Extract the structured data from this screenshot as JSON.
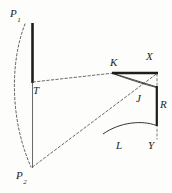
{
  "figure": {
    "background_color": "#fdfdfc",
    "ink_color": "#1d1d1d",
    "labels": {
      "p1": "P",
      "p1_sub": "1",
      "p2": "P",
      "p2_sub": "2",
      "t": "T",
      "k": "K",
      "x": "X",
      "j": "J",
      "r": "R",
      "l": "L",
      "y": "Y"
    },
    "elements": [
      {
        "name": "left-thick-bar",
        "type": "line",
        "style": "solid-thick",
        "from": [
          32,
          23
        ],
        "to": [
          32,
          82
        ]
      },
      {
        "name": "left-thin-bar",
        "type": "line",
        "style": "solid-thin",
        "from": [
          32,
          82
        ],
        "to": [
          32,
          168
        ]
      },
      {
        "name": "left-dashed-arc",
        "type": "arc",
        "style": "dashed",
        "from": [
          25,
          23
        ],
        "to": [
          32,
          168
        ],
        "bulge": "left"
      },
      {
        "name": "t-to-k-dashed",
        "type": "line",
        "style": "dashed",
        "from": [
          32,
          82
        ],
        "to": [
          113,
          73
        ]
      },
      {
        "name": "p2-to-x-dashed",
        "type": "line",
        "style": "dashed",
        "from": [
          32,
          168
        ],
        "to": [
          157,
          73
        ]
      },
      {
        "name": "kx-thick-bar",
        "type": "line",
        "style": "solid-thick",
        "from": [
          113,
          73
        ],
        "to": [
          157,
          73
        ]
      },
      {
        "name": "k-to-r-line",
        "type": "line",
        "style": "solid-thin",
        "from": [
          113,
          73
        ],
        "to": [
          157,
          87
        ]
      },
      {
        "name": "k-arc-to-r",
        "type": "arc",
        "style": "solid-thin",
        "from": [
          113,
          73
        ],
        "to": [
          157,
          87
        ],
        "bulge": "down"
      },
      {
        "name": "r-vertical-bar",
        "type": "line",
        "style": "solid-thick",
        "from": [
          157,
          87
        ],
        "to": [
          157,
          125
        ]
      },
      {
        "name": "l-arc",
        "type": "arc",
        "style": "solid-thin",
        "from": [
          103,
          133
        ],
        "to": [
          157,
          125
        ],
        "bulge": "up"
      },
      {
        "name": "y-dashed-vertical",
        "type": "line",
        "style": "dashed",
        "from": [
          157,
          73
        ],
        "to": [
          157,
          140
        ]
      }
    ]
  }
}
